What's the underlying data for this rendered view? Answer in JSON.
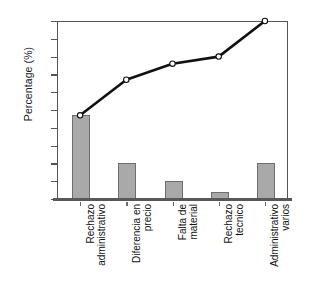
{
  "chart_data": {
    "type": "bar",
    "title": "",
    "xlabel": "",
    "ylabel": "Percentage (%)",
    "ylim": [
      0,
      100
    ],
    "ytick_step": 10,
    "ytick_labels": [
      "100",
      "90",
      "80",
      "70",
      "60",
      "50",
      "40",
      "30",
      "20",
      "10",
      "0"
    ],
    "grid": false,
    "legend": "none",
    "categories": [
      "Rechazo administrativo",
      "Diferencia en precio",
      "Falta de material",
      "Rechazo tecnico",
      "Administrativo varios"
    ],
    "category_lines": [
      [
        "Rechazo",
        "administrativo"
      ],
      [
        "Diferencia en",
        "precio"
      ],
      [
        "Falta de",
        "material"
      ],
      [
        "Rechazo",
        "tecnico"
      ],
      [
        "Administrativo",
        "varios"
      ]
    ],
    "series": [
      {
        "name": "Percentage",
        "type": "bar",
        "values": [
          47,
          20,
          10,
          4,
          20
        ]
      },
      {
        "name": "Cumulative percentage",
        "type": "line",
        "values": [
          47,
          67,
          76,
          80,
          100
        ]
      }
    ],
    "colors": {
      "bar_fill": "#a9a9a9",
      "bar_edge": "#6e6e70",
      "line": "#111111",
      "marker_fill": "#ffffff",
      "axis": "#555555",
      "background": "#ffffff"
    }
  }
}
